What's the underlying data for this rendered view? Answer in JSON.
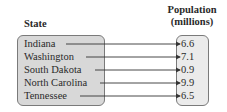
{
  "headers": {
    "domain": "State",
    "range_line1": "Population",
    "range_line2": "(millions)"
  },
  "mapping": [
    {
      "state": "Indiana",
      "population": "6.6"
    },
    {
      "state": "Washington",
      "population": "7.1"
    },
    {
      "state": "South Dakota",
      "population": "0.9"
    },
    {
      "state": "North Carolina",
      "population": "9.9"
    },
    {
      "state": "Tennessee",
      "population": "6.5"
    }
  ]
}
